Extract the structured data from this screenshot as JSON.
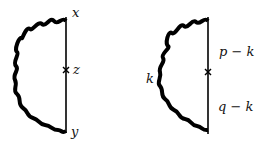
{
  "diagrams": [
    {
      "name": "position-space",
      "labels": {
        "top": "x",
        "middle": "z",
        "bottom": "y"
      }
    },
    {
      "name": "momentum-space",
      "labels": {
        "upper": "p − k",
        "lower": "q − k",
        "loop": "k"
      }
    }
  ],
  "colors": {
    "line": "#000000",
    "background": "#ffffff"
  }
}
